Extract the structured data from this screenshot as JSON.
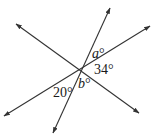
{
  "diagram": {
    "type": "intersecting-lines-angles",
    "stroke_color": "#333333",
    "background": "#ffffff",
    "intersection": {
      "x": 81,
      "y": 69
    },
    "lines": [
      {
        "id": "line-1",
        "from": {
          "x": 53,
          "y": 133
        },
        "to": {
          "x": 110,
          "y": 8
        }
      },
      {
        "id": "line-2",
        "from": {
          "x": 4,
          "y": 116
        },
        "to": {
          "x": 150,
          "y": 26
        }
      },
      {
        "id": "line-3",
        "from": {
          "x": 16,
          "y": 24
        },
        "to": {
          "x": 139,
          "y": 113
        }
      }
    ],
    "labels": {
      "a": {
        "var": "a",
        "unit": "°"
      },
      "angle_34": {
        "text": "34°"
      },
      "b": {
        "var": "b",
        "unit": "°"
      },
      "angle_20": {
        "text": "20°"
      }
    }
  }
}
